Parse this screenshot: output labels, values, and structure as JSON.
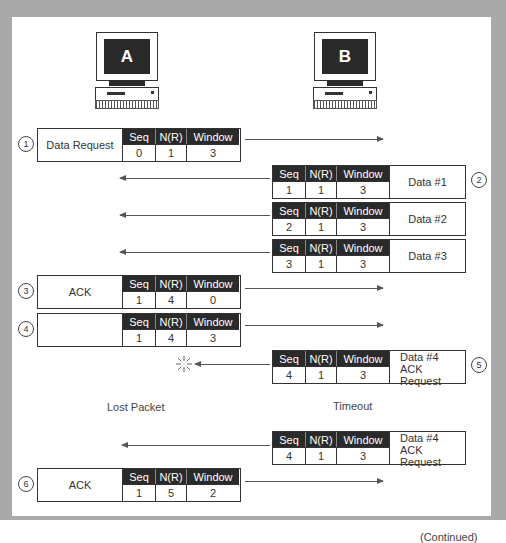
{
  "computers": {
    "a": {
      "label": "A"
    },
    "b": {
      "label": "B"
    }
  },
  "field_headers": {
    "seq": "Seq",
    "nr": "N(R)",
    "window": "Window"
  },
  "packets": [
    {
      "step": "1",
      "direction": "A→B",
      "label": "Data Request",
      "seq": "0",
      "nr": "1",
      "window": "3"
    },
    {
      "step": "2",
      "direction": "B→A",
      "label": "Data #1",
      "seq": "1",
      "nr": "1",
      "window": "3"
    },
    {
      "step": "",
      "direction": "B→A",
      "label": "Data #2",
      "seq": "2",
      "nr": "1",
      "window": "3"
    },
    {
      "step": "",
      "direction": "B→A",
      "label": "Data #3",
      "seq": "3",
      "nr": "1",
      "window": "3"
    },
    {
      "step": "3",
      "direction": "A→B",
      "label": "ACK",
      "seq": "1",
      "nr": "4",
      "window": "0"
    },
    {
      "step": "4",
      "direction": "A→B",
      "label": "",
      "seq": "1",
      "nr": "4",
      "window": "3"
    },
    {
      "step": "5",
      "direction": "B→A",
      "label_line1": "Data #4",
      "label_line2": "ACK Request",
      "seq": "4",
      "nr": "1",
      "window": "3",
      "lost": true
    },
    {
      "step": "",
      "direction": "B→A",
      "label_line1": "Data #4",
      "label_line2": "ACK Request",
      "seq": "4",
      "nr": "1",
      "window": "3"
    },
    {
      "step": "6",
      "direction": "A→B",
      "label": "ACK",
      "seq": "1",
      "nr": "5",
      "window": "2"
    }
  ],
  "notes": {
    "lost_packet": "Lost Packet",
    "timeout": "Timeout"
  },
  "footer": {
    "continued": "(Continued)"
  },
  "colors": {
    "frame": "#a9a9a9",
    "header_fill": "#2a2a2a",
    "panel": "#ffffff"
  }
}
